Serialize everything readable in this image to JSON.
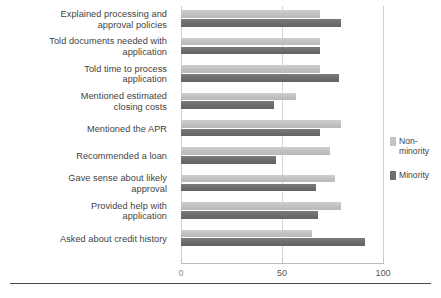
{
  "chart_data": {
    "type": "bar",
    "orientation": "horizontal",
    "title": "",
    "xlabel": "",
    "ylabel": "",
    "xlim": [
      0,
      100
    ],
    "xticks": [
      0,
      50,
      100
    ],
    "xtick_labels": [
      "0",
      "50",
      "100"
    ],
    "grid": true,
    "legend_position": "right",
    "categories": [
      "Explained processing and\napproval policies",
      "Told documents needed with\napplication",
      "Told time to process\napplication",
      "Mentioned estimated\nclosing costs",
      "Mentioned the APR",
      "Recommended a loan",
      "Gave sense about likely\napproval",
      "Provided help with\napplication",
      "Asked about credit history"
    ],
    "series": [
      {
        "name": "Non-minority",
        "color": "#c3c3c3",
        "values": [
          69,
          69,
          69,
          57,
          79,
          74,
          76,
          79,
          65
        ]
      },
      {
        "name": "Minority",
        "color": "#6f6f6f",
        "values": [
          79,
          69,
          78,
          46,
          69,
          47,
          67,
          68,
          91
        ]
      }
    ]
  },
  "legend": {
    "items": [
      {
        "label": "Non-\nminority",
        "color": "#c3c3c3"
      },
      {
        "label": "Minority",
        "color": "#6f6f6f"
      }
    ]
  },
  "caption": {
    "text": ""
  }
}
